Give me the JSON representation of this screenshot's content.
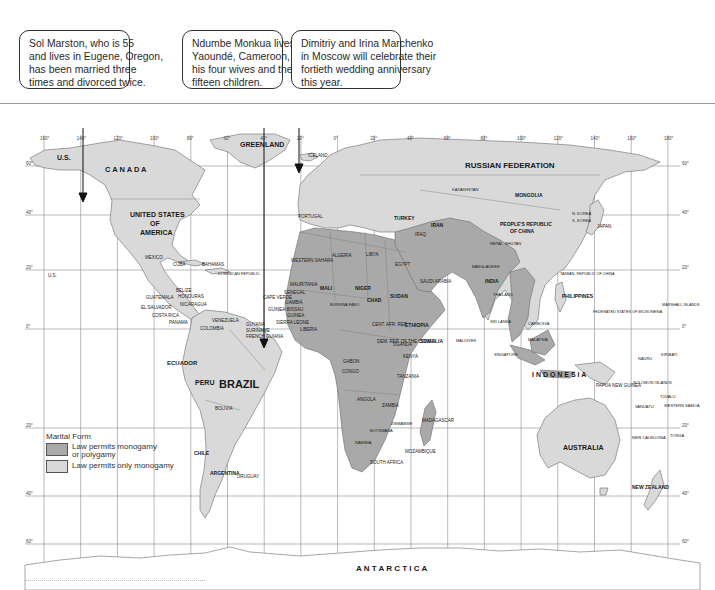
{
  "callouts": [
    {
      "id": "marston",
      "lines": [
        "Sol Marston, who is 55",
        "and lives in Eugene, Oregon,",
        "has been married three",
        "times and divorced twice."
      ],
      "box": {
        "left": 19,
        "width": 111
      },
      "pointer": {
        "x": 83,
        "y_top": 89,
        "y_bottom": 199
      }
    },
    {
      "id": "monkua",
      "lines": [
        "Ndumbe Monkua lives in",
        "Yaoundé, Cameroon, with",
        "his four wives and their",
        "fifteen children."
      ],
      "box": {
        "left": 182,
        "width": 101
      },
      "pointer": {
        "x": 264,
        "y_top": 89,
        "y_bottom": 345
      }
    },
    {
      "id": "marchenko",
      "lines": [
        "Dimitriy and Irina Marchenko",
        "in Moscow will celebrate their",
        "fortieth wedding anniversary",
        "this year."
      ],
      "box": {
        "left": 291,
        "width": 110
      },
      "pointer": {
        "x": 299,
        "y_top": 89,
        "y_bottom": 170
      }
    }
  ],
  "map": {
    "title": "World map of marital forms",
    "colors": {
      "polygamy": "#a9a9a9",
      "monogamy": "#d9d9d9",
      "ocean": "#ffffff",
      "grid": "#8a8a8a",
      "border": "#6b6b6b"
    },
    "longitude_labels": [
      "160°",
      "140°",
      "120°",
      "100°",
      "80°",
      "60°",
      "40°",
      "20°",
      "0°",
      "20°",
      "40°",
      "60°",
      "80°",
      "100°",
      "120°",
      "140°",
      "160°",
      "180°"
    ],
    "latitude_labels": [
      {
        "label": "60°",
        "y": 166
      },
      {
        "label": "40°",
        "y": 215
      },
      {
        "label": "20°",
        "y": 270
      },
      {
        "label": "0°",
        "y": 329
      },
      {
        "label": "20°",
        "y": 428
      },
      {
        "label": "40°",
        "y": 496
      },
      {
        "label": "60°",
        "y": 544
      }
    ],
    "region_labels": [
      {
        "text": "U.S.",
        "x": 57,
        "y": 160,
        "size": 7
      },
      {
        "text": "C A N A D A",
        "x": 105,
        "y": 172,
        "size": 7.5
      },
      {
        "text": "GREENLAND",
        "x": 240,
        "y": 147,
        "size": 7
      },
      {
        "text": "ICELAND",
        "x": 308,
        "y": 157,
        "size": 4.5
      },
      {
        "text": "UNITED STATES",
        "x": 130,
        "y": 217,
        "size": 7
      },
      {
        "text": "OF",
        "x": 150,
        "y": 226,
        "size": 7
      },
      {
        "text": "AMERICA",
        "x": 140,
        "y": 235,
        "size": 7
      },
      {
        "text": "MEXICO",
        "x": 145,
        "y": 259,
        "size": 4.5
      },
      {
        "text": "U.S.",
        "x": 48,
        "y": 277,
        "size": 4.5
      },
      {
        "text": "CUBA",
        "x": 173,
        "y": 266,
        "size": 4.5
      },
      {
        "text": "BAHAMAS",
        "x": 202,
        "y": 266,
        "size": 4.5
      },
      {
        "text": "DOMINICAN REPUBLIC",
        "x": 218,
        "y": 275,
        "size": 3.8
      },
      {
        "text": "BELIZE",
        "x": 176,
        "y": 292,
        "size": 4.5
      },
      {
        "text": "GUATEMALA",
        "x": 146,
        "y": 299,
        "size": 4.5
      },
      {
        "text": "HONDURAS",
        "x": 178,
        "y": 298,
        "size": 4.5
      },
      {
        "text": "EL SALVADOR",
        "x": 141,
        "y": 309,
        "size": 4.5
      },
      {
        "text": "NICARAGUA",
        "x": 180,
        "y": 306,
        "size": 4.5
      },
      {
        "text": "COSTA RICA",
        "x": 152,
        "y": 317,
        "size": 4.5
      },
      {
        "text": "PANAMA",
        "x": 169,
        "y": 324,
        "size": 4.5
      },
      {
        "text": "VENEZUELA",
        "x": 212,
        "y": 322,
        "size": 4.5
      },
      {
        "text": "GUYANA",
        "x": 246,
        "y": 326,
        "size": 4.5
      },
      {
        "text": "SURINAME",
        "x": 246,
        "y": 332,
        "size": 4.5
      },
      {
        "text": "FRENCH GUIANA",
        "x": 246,
        "y": 338,
        "size": 4.5
      },
      {
        "text": "COLOMBIA",
        "x": 200,
        "y": 330,
        "size": 4.5
      },
      {
        "text": "ECUADOR",
        "x": 167,
        "y": 365,
        "size": 6
      },
      {
        "text": "BRAZIL",
        "x": 219,
        "y": 388,
        "size": 11
      },
      {
        "text": "PERU",
        "x": 195,
        "y": 385,
        "size": 7
      },
      {
        "text": "BOLIVIA",
        "x": 215,
        "y": 410,
        "size": 4.5
      },
      {
        "text": "CHILE",
        "x": 194,
        "y": 455,
        "size": 5
      },
      {
        "text": "ARGENTINA",
        "x": 210,
        "y": 475,
        "size": 5
      },
      {
        "text": "URUGUAY",
        "x": 237,
        "y": 478,
        "size": 4.5
      },
      {
        "text": "PORTUGAL",
        "x": 298,
        "y": 218,
        "size": 4.5
      },
      {
        "text": "WESTERN SAHARA",
        "x": 291,
        "y": 262,
        "size": 4.5
      },
      {
        "text": "ALGERIA",
        "x": 332,
        "y": 257,
        "size": 4.5
      },
      {
        "text": "LIBYA",
        "x": 366,
        "y": 256,
        "size": 4.5
      },
      {
        "text": "EGYPT",
        "x": 395,
        "y": 266,
        "size": 4.5
      },
      {
        "text": "MAURITANIA",
        "x": 290,
        "y": 286,
        "size": 4.5
      },
      {
        "text": "SENEGAL",
        "x": 284,
        "y": 294,
        "size": 4.5
      },
      {
        "text": "CAPE VERDE",
        "x": 263,
        "y": 299,
        "size": 4.5
      },
      {
        "text": "GAMBIA",
        "x": 285,
        "y": 304,
        "size": 4.5
      },
      {
        "text": "GUINEA-BISSAU",
        "x": 268,
        "y": 311,
        "size": 4.5
      },
      {
        "text": "GUINEA",
        "x": 287,
        "y": 317,
        "size": 4.5
      },
      {
        "text": "SIERRA LEONE",
        "x": 276,
        "y": 324,
        "size": 4.5
      },
      {
        "text": "LIBERIA",
        "x": 300,
        "y": 331,
        "size": 4.5
      },
      {
        "text": "MALI",
        "x": 320,
        "y": 290,
        "size": 5
      },
      {
        "text": "NIGER",
        "x": 355,
        "y": 290,
        "size": 5
      },
      {
        "text": "CHAD",
        "x": 367,
        "y": 302,
        "size": 5
      },
      {
        "text": "SUDAN",
        "x": 390,
        "y": 298,
        "size": 5
      },
      {
        "text": "BURKINA FASO",
        "x": 330,
        "y": 306,
        "size": 4
      },
      {
        "text": "ETHIOPIA",
        "x": 405,
        "y": 327,
        "size": 5
      },
      {
        "text": "SOMALIA",
        "x": 420,
        "y": 343,
        "size": 5
      },
      {
        "text": "CENT. AFR. REP.",
        "x": 372,
        "y": 326,
        "size": 4.5
      },
      {
        "text": "DEM. REP. OF THE CONGO",
        "x": 377,
        "y": 343,
        "size": 4.5
      },
      {
        "text": "UGANDA",
        "x": 393,
        "y": 346,
        "size": 4.5
      },
      {
        "text": "KENYA",
        "x": 403,
        "y": 358,
        "size": 4.5
      },
      {
        "text": "TANZANIA",
        "x": 397,
        "y": 378,
        "size": 4.5
      },
      {
        "text": "GABON",
        "x": 343,
        "y": 363,
        "size": 4.5
      },
      {
        "text": "CONGO",
        "x": 342,
        "y": 373,
        "size": 4.5
      },
      {
        "text": "ANGOLA",
        "x": 357,
        "y": 401,
        "size": 4.5
      },
      {
        "text": "ZAMBIA",
        "x": 382,
        "y": 407,
        "size": 4.5
      },
      {
        "text": "ZIMBABWE",
        "x": 391,
        "y": 425,
        "size": 4
      },
      {
        "text": "BOTSWANA",
        "x": 370,
        "y": 432,
        "size": 4
      },
      {
        "text": "NAMIBIA",
        "x": 355,
        "y": 444,
        "size": 4
      },
      {
        "text": "MOZAMBIQUE",
        "x": 405,
        "y": 453,
        "size": 4.5
      },
      {
        "text": "SOUTH AFRICA",
        "x": 370,
        "y": 464,
        "size": 4.5
      },
      {
        "text": "MADAGASCAR",
        "x": 422,
        "y": 422,
        "size": 4.5
      },
      {
        "text": "SAUDI ARABIA",
        "x": 420,
        "y": 283,
        "size": 4.5
      },
      {
        "text": "TURKEY",
        "x": 394,
        "y": 220,
        "size": 5
      },
      {
        "text": "IRAQ",
        "x": 415,
        "y": 236,
        "size": 4.5
      },
      {
        "text": "IRAN",
        "x": 431,
        "y": 227,
        "size": 5
      },
      {
        "text": "INDIA",
        "x": 485,
        "y": 283,
        "size": 5
      },
      {
        "text": "RUSSIAN FEDERATION",
        "x": 465,
        "y": 168,
        "size": 8
      },
      {
        "text": "KAZAKHSTAN",
        "x": 452,
        "y": 191,
        "size": 4
      },
      {
        "text": "MONGOLIA",
        "x": 515,
        "y": 197,
        "size": 5
      },
      {
        "text": "PEOPLE'S REPUBLIC",
        "x": 500,
        "y": 226,
        "size": 5
      },
      {
        "text": "OF CHINA",
        "x": 510,
        "y": 233,
        "size": 5
      },
      {
        "text": "N. KOREA",
        "x": 572,
        "y": 215,
        "size": 4
      },
      {
        "text": "S. KOREA",
        "x": 572,
        "y": 222,
        "size": 4
      },
      {
        "text": "JAPAN",
        "x": 597,
        "y": 228,
        "size": 4.5
      },
      {
        "text": "NEPAL",
        "x": 490,
        "y": 245,
        "size": 4
      },
      {
        "text": "BHUTAN",
        "x": 505,
        "y": 245,
        "size": 4
      },
      {
        "text": "BANGLADESH",
        "x": 472,
        "y": 268,
        "size": 4
      },
      {
        "text": "TAIWAN, REPUBLIC OF CHINA",
        "x": 560,
        "y": 275,
        "size": 3.8
      },
      {
        "text": "PHILIPPINES",
        "x": 562,
        "y": 298,
        "size": 5
      },
      {
        "text": "THAILAND",
        "x": 493,
        "y": 296,
        "size": 4
      },
      {
        "text": "SRI LANKA",
        "x": 490,
        "y": 323,
        "size": 4
      },
      {
        "text": "MALDIVES",
        "x": 456,
        "y": 342,
        "size": 4
      },
      {
        "text": "CAMBODIA",
        "x": 528,
        "y": 325,
        "size": 4
      },
      {
        "text": "MALAYSIA",
        "x": 528,
        "y": 341,
        "size": 4
      },
      {
        "text": "SINGAPORE",
        "x": 494,
        "y": 356,
        "size": 4
      },
      {
        "text": "I N D O N E S I A",
        "x": 532,
        "y": 377,
        "size": 7
      },
      {
        "text": "PAPUA NEW GUINEA",
        "x": 596,
        "y": 387,
        "size": 4.5
      },
      {
        "text": "FEDERATED STATES OF MICRONESIA",
        "x": 593,
        "y": 313,
        "size": 3.8
      },
      {
        "text": "MARSHALL ISLANDS",
        "x": 662,
        "y": 306,
        "size": 3.8
      },
      {
        "text": "NAURU",
        "x": 638,
        "y": 360,
        "size": 4
      },
      {
        "text": "KIRIBATI",
        "x": 661,
        "y": 356,
        "size": 4
      },
      {
        "text": "SOLOMON ISLANDS",
        "x": 633,
        "y": 384,
        "size": 4
      },
      {
        "text": "VANUATU",
        "x": 635,
        "y": 408,
        "size": 4
      },
      {
        "text": "TUVALU",
        "x": 660,
        "y": 398,
        "size": 4
      },
      {
        "text": "WESTERN SAMOA",
        "x": 664,
        "y": 407,
        "size": 4
      },
      {
        "text": "NEW CALEDONIA",
        "x": 632,
        "y": 439,
        "size": 4
      },
      {
        "text": "TONGA",
        "x": 670,
        "y": 437,
        "size": 4
      },
      {
        "text": "AUSTRALIA",
        "x": 563,
        "y": 450,
        "size": 7
      },
      {
        "text": "NEW ZEALAND",
        "x": 632,
        "y": 489,
        "size": 5
      },
      {
        "text": "A N T A R C T I C A",
        "x": 356,
        "y": 571,
        "size": 8
      }
    ]
  },
  "legend": {
    "title": "Marital Form",
    "items": [
      {
        "label_lines": [
          "Law permits monogamy",
          "or polygamy"
        ],
        "color": "#a9a9a9"
      },
      {
        "label_lines": [
          "Law permits only monogamy"
        ],
        "color": "#d9d9d9"
      }
    ]
  }
}
